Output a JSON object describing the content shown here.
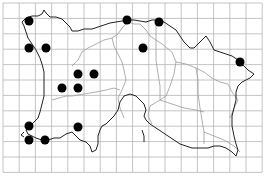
{
  "map": {
    "type": "distribution-grid-map",
    "width": 268,
    "height": 180,
    "grid": {
      "x0": 3,
      "y0": 3,
      "x1": 262,
      "y1": 172,
      "cell_w": 16.2,
      "cell_h": 15.4,
      "color": "#b5b5b5"
    },
    "colors": {
      "background": "#ffffff",
      "coastline": "#222222",
      "parish_boundary": "#9a9a9a",
      "dot": "#000000"
    },
    "dots": [
      {
        "x": 29,
        "y": 21
      },
      {
        "x": 127,
        "y": 20
      },
      {
        "x": 159,
        "y": 22
      },
      {
        "x": 29,
        "y": 48
      },
      {
        "x": 46,
        "y": 48
      },
      {
        "x": 143,
        "y": 48
      },
      {
        "x": 240,
        "y": 62
      },
      {
        "x": 78,
        "y": 74
      },
      {
        "x": 94,
        "y": 74
      },
      {
        "x": 62,
        "y": 88
      },
      {
        "x": 78,
        "y": 88
      },
      {
        "x": 29,
        "y": 126
      },
      {
        "x": 78,
        "y": 127
      },
      {
        "x": 29,
        "y": 140
      },
      {
        "x": 45,
        "y": 140
      }
    ],
    "dot_radius": 4.5
  }
}
